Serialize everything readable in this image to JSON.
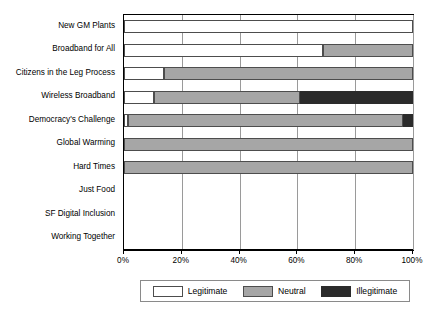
{
  "chart_data": {
    "type": "bar",
    "orientation": "horizontal",
    "stacked": true,
    "normalized_percent": true,
    "title": "",
    "subtitle": "",
    "xlabel": "",
    "ylabel": "",
    "xlim": [
      0,
      100
    ],
    "xticks": [
      0,
      20,
      40,
      60,
      80,
      100
    ],
    "xticklabels": [
      "0%",
      "20%",
      "40%",
      "60%",
      "80%",
      "100%"
    ],
    "grid": "vertical",
    "legend_position": "bottom",
    "categories": [
      "New GM Plants",
      "Broadband for All",
      "Citizens in the Leg Process",
      "Wireless Broadband",
      "Democracy's Challenge",
      "Global Warming",
      "Hard Times",
      "Just Food",
      "SF Digital Inclusion",
      "Working Together"
    ],
    "series": [
      {
        "name": "Legitimate",
        "color": "#ffffff",
        "values": [
          100,
          69,
          14,
          10.5,
          1.5,
          0,
          0,
          0,
          0,
          0
        ]
      },
      {
        "name": "Neutral",
        "color": "#a6a6a6",
        "values": [
          0,
          31,
          86,
          50.5,
          95,
          100,
          100,
          0,
          0,
          0
        ]
      },
      {
        "name": "Illegitimate",
        "color": "#2b2b2b",
        "values": [
          0,
          0,
          0,
          39,
          3.5,
          0,
          0,
          0,
          0,
          0
        ]
      }
    ],
    "empty_categories": [
      "Just Food",
      "SF Digital Inclusion",
      "Working Together"
    ]
  },
  "legend": {
    "items": [
      {
        "label": "Legitimate",
        "swatch": "legit"
      },
      {
        "label": "Neutral",
        "swatch": "neutral"
      },
      {
        "label": "Illegitimate",
        "swatch": "illegit"
      }
    ]
  },
  "axis": {
    "tick_labels": [
      "0%",
      "20%",
      "40%",
      "60%",
      "80%",
      "100%"
    ]
  },
  "colors": {
    "legitimate": "#ffffff",
    "neutral": "#a6a6a6",
    "illegitimate": "#2b2b2b",
    "frame": "#000000",
    "gridline": "#9a9a9a"
  }
}
